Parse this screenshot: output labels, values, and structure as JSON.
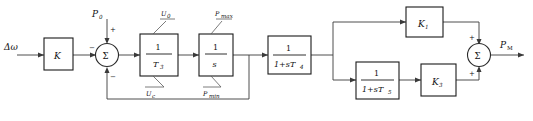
{
  "diagram": {
    "input_signal": "Δω",
    "output_signal": "P",
    "output_subscript": "M",
    "setpoint_label": "P",
    "setpoint_subscript": "0",
    "blocks": [
      {
        "id": "gain-k",
        "label": "K",
        "type": "gain"
      },
      {
        "id": "integrator-t3",
        "numerator": "1",
        "denominator": "T",
        "denominator_sub": "3",
        "type": "limited-integrator",
        "upper_limit": "U",
        "upper_limit_sub": "0",
        "lower_limit": "U",
        "lower_limit_sub": "c"
      },
      {
        "id": "integrator-s",
        "numerator": "1",
        "denominator": "s",
        "denominator_sub": "",
        "type": "limited-integrator",
        "upper_limit": "P",
        "upper_limit_sub": "max",
        "lower_limit": "P",
        "lower_limit_sub": "min"
      },
      {
        "id": "lag-t4",
        "numerator": "1",
        "denominator": "1+sT",
        "denominator_sub": "4",
        "type": "first-order-lag"
      },
      {
        "id": "gain-k1",
        "label": "K",
        "label_sub": "1",
        "type": "gain"
      },
      {
        "id": "lag-t5",
        "numerator": "1",
        "denominator": "1+sT",
        "denominator_sub": "5",
        "type": "first-order-lag"
      },
      {
        "id": "gain-k3",
        "label": "K",
        "label_sub": "3",
        "type": "gain"
      }
    ],
    "summing_junctions": [
      {
        "id": "sum-input",
        "symbol": "Σ",
        "signs": {
          "left": "−",
          "top": "+",
          "bottom": "−"
        }
      },
      {
        "id": "sum-output",
        "symbol": "Σ",
        "signs": {
          "top": "+",
          "bottom": "+"
        }
      }
    ],
    "limit_labels": {
      "u0": "U",
      "u0_sub": "0",
      "uc": "U",
      "uc_sub": "c",
      "pmax": "P",
      "pmax_sub": "max",
      "pmin": "P",
      "pmin_sub": "min"
    }
  }
}
